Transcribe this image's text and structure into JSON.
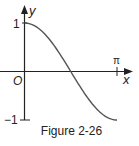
{
  "chart_data": {
    "type": "line",
    "title": "",
    "caption": "Figure 2-26",
    "xlabel": "x",
    "ylabel": "y",
    "origin_label": "O",
    "x_tick_labels": [
      "π"
    ],
    "y_tick_labels": [
      "1",
      "−1"
    ],
    "xlim": [
      0,
      3.14159
    ],
    "ylim": [
      -1,
      1
    ],
    "grid": false,
    "series": [
      {
        "name": "y = cos x",
        "x": [
          0,
          0.3927,
          0.7854,
          1.1781,
          1.5708,
          1.9635,
          2.3562,
          2.7489,
          3.14159
        ],
        "y": [
          1,
          0.924,
          0.707,
          0.383,
          0,
          -0.383,
          -0.707,
          -0.924,
          -1
        ]
      }
    ],
    "colors": {
      "curve": "#555555",
      "axes": "#222222"
    }
  },
  "labels": {
    "y_axis": "y",
    "x_axis": "x",
    "origin": "O",
    "y_one": "1",
    "y_neg_one": "−1",
    "x_pi": "π",
    "caption": "Figure 2-26"
  }
}
